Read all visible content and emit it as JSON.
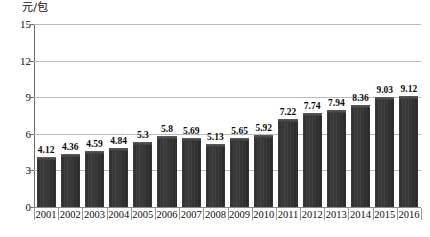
{
  "chart_data": {
    "type": "bar",
    "title": "",
    "xlabel": "",
    "ylabel": "元/包",
    "ylim": [
      0,
      15
    ],
    "yticks": [
      0,
      3,
      6,
      9,
      12,
      15
    ],
    "grid": true,
    "legend": null,
    "categories": [
      "2001",
      "2002",
      "2003",
      "2004",
      "2005",
      "2006",
      "2007",
      "2008",
      "2009",
      "2010",
      "2011",
      "2012",
      "2013",
      "2014",
      "2015",
      "2016"
    ],
    "values": [
      4.12,
      4.36,
      4.59,
      4.84,
      5.3,
      5.8,
      5.69,
      5.13,
      5.65,
      5.92,
      7.22,
      7.74,
      7.94,
      8.36,
      9.03,
      9.12
    ],
    "value_labels": [
      "4.12",
      "4.36",
      "4.59",
      "4.84",
      "5.3",
      "5.8",
      "5.69",
      "5.13",
      "5.65",
      "5.92",
      "7.22",
      "7.74",
      "7.94",
      "8.36",
      "9.03",
      "9.12"
    ],
    "series": [
      {
        "name": "元/包",
        "values": [
          4.12,
          4.36,
          4.59,
          4.84,
          5.3,
          5.8,
          5.69,
          5.13,
          5.65,
          5.92,
          7.22,
          7.74,
          7.94,
          8.36,
          9.03,
          9.12
        ]
      }
    ]
  },
  "axes": {
    "y_unit_label": "元/包",
    "y_tick_labels": [
      "15",
      "12",
      "9",
      "6",
      "3",
      "0"
    ],
    "x_tick_labels": [
      "2001",
      "2002",
      "2003",
      "2004",
      "2005",
      "2006",
      "2007",
      "2008",
      "2009",
      "2010",
      "2011",
      "2012",
      "2013",
      "2014",
      "2015",
      "2016"
    ]
  },
  "caption": {
    "text": ""
  },
  "colors": {
    "bar_fill": "#333333",
    "bar_top_bevel": "#5c5c5c",
    "gridline": "#b9b9b9",
    "axis_line": "#6e6e6e",
    "text": "#0d0d0d",
    "background": "#ffffff"
  }
}
